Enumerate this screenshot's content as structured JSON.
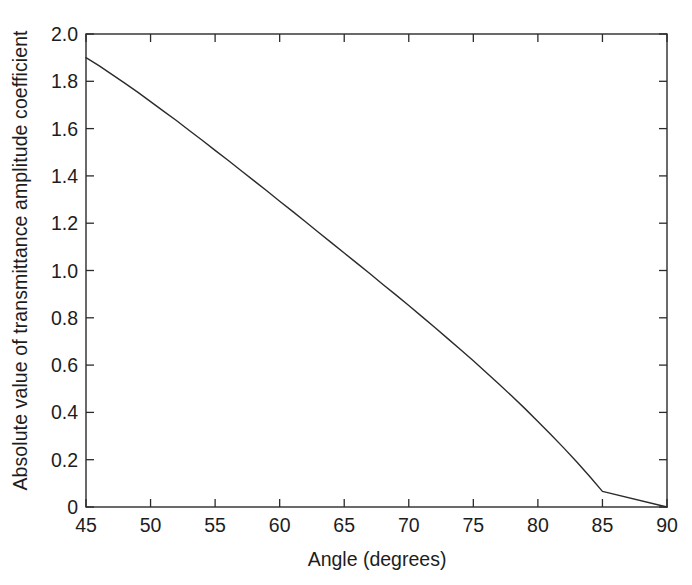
{
  "chart_data": {
    "type": "line",
    "title": "",
    "xlabel": "Angle (degrees)",
    "ylabel": "Absolute value of transmittance amplitude coefficient",
    "xlim": [
      45,
      90
    ],
    "ylim": [
      0,
      2.0
    ],
    "grid": false,
    "legend": null,
    "xticks": [
      45,
      50,
      55,
      60,
      65,
      70,
      75,
      80,
      85,
      90
    ],
    "xtick_labels": [
      "45",
      "50",
      "55",
      "60",
      "65",
      "70",
      "75",
      "80",
      "85",
      "90"
    ],
    "yticks": [
      0,
      0.2,
      0.4,
      0.6,
      0.8,
      1.0,
      1.2,
      1.4,
      1.6,
      1.8,
      2.0
    ],
    "ytick_labels": [
      "0",
      "0.2",
      "0.4",
      "0.6",
      "0.8",
      "1.0",
      "1.2",
      "1.4",
      "1.6",
      "1.8",
      "2.0"
    ],
    "frame": "box",
    "tick_direction": "in",
    "line_color": "#2b2b2b",
    "line_width": 1.4,
    "series": [
      {
        "name": "transmittance amplitude coefficient",
        "x": [
          45,
          46,
          47,
          48,
          49,
          50,
          51,
          52,
          53,
          54,
          55,
          56,
          57,
          58,
          59,
          60,
          61,
          62,
          63,
          64,
          65,
          66,
          67,
          68,
          69,
          70,
          71,
          72,
          73,
          74,
          75,
          76,
          77,
          78,
          79,
          80,
          81,
          82,
          83,
          84,
          85,
          86,
          87,
          88,
          89,
          90
        ],
        "y": [
          1.9,
          1.866,
          1.829,
          1.792,
          1.754,
          1.714,
          1.674,
          1.634,
          1.592,
          1.551,
          1.508,
          1.466,
          1.423,
          1.38,
          1.337,
          1.293,
          1.25,
          1.206,
          1.162,
          1.118,
          1.074,
          1.03,
          0.986,
          0.941,
          0.897,
          0.852,
          0.806,
          0.76,
          0.713,
          0.666,
          0.618,
          0.569,
          0.519,
          0.468,
          0.416,
          0.362,
          0.307,
          0.25,
          0.191,
          0.13,
          0.066,
          0.0,
          0.0,
          0.0,
          0.0,
          0.0
        ]
      }
    ],
    "endpoint_note": "curve terminates at (90, 0)"
  },
  "axes": {
    "xlabel": "Angle (degrees)",
    "ylabel": "Absolute value of transmittance amplitude coefficient"
  }
}
